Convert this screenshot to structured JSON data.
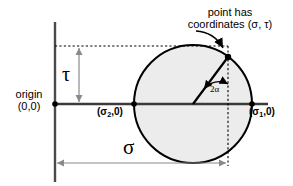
{
  "figure": {
    "type": "mohr-circle-diagram",
    "background_color": "#ffffff",
    "stroke_color": "#000000",
    "circle_fill_color": "#ececec",
    "guide_color": "#808080"
  },
  "labels": {
    "callout_line1": "point has",
    "callout_line2": "coordinates (σ, τ)",
    "origin_line1": "origin",
    "origin_line2": "(0,0)",
    "tau_axis": "τ",
    "sigma_axis": "σ",
    "sigma2_point_prefix": "(σ",
    "sigma2_point_sub": "2",
    "sigma2_point_suffix": ",0)",
    "sigma1_point_prefix": "(σ",
    "sigma1_point_sub": "1",
    "sigma1_point_suffix": ",0)",
    "angle": "2α"
  },
  "geometry": {
    "origin_x": 55,
    "origin_y": 104,
    "circle_center_x": 193,
    "circle_center_y": 104,
    "circle_radius": 59,
    "point_x": 228,
    "point_y": 57,
    "sigma_arrow_y": 163,
    "tau_dotted_y": 46
  }
}
